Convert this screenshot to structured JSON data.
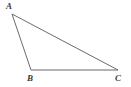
{
  "figure": {
    "type": "geometry-diagram",
    "shape": "triangle",
    "background_color": "#ffffff",
    "stroke_color": "#6b6b70",
    "stroke_width": 1,
    "label_color": "#3a3a3a",
    "labels": {
      "a": "A",
      "b": "B",
      "c": "C"
    },
    "vertices": [
      {
        "name": "A",
        "x": 12,
        "y": 14
      },
      {
        "name": "B",
        "x": 31,
        "y": 70
      },
      {
        "name": "C",
        "x": 118,
        "y": 70
      }
    ],
    "edges": [
      {
        "name": "AB",
        "from": "A",
        "to": "B"
      },
      {
        "name": "BC",
        "from": "B",
        "to": "C"
      },
      {
        "name": "AC",
        "from": "A",
        "to": "C"
      }
    ],
    "polygon_points": "12,14 31,70 118,70"
  }
}
